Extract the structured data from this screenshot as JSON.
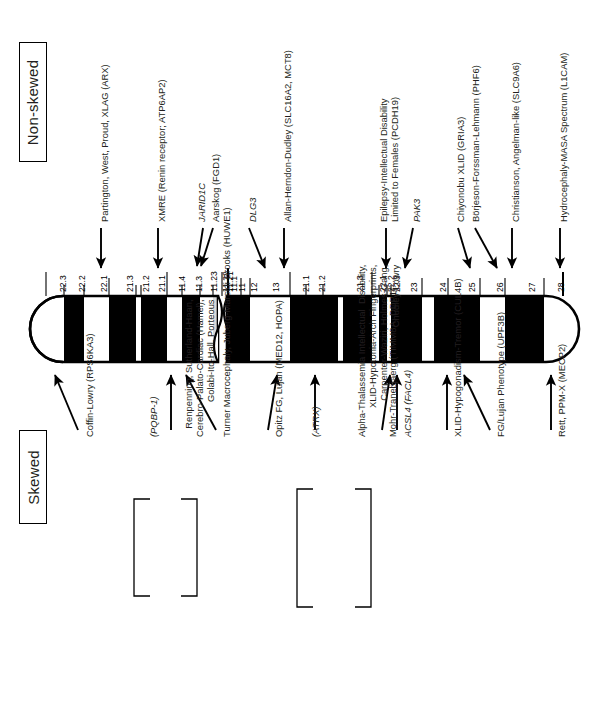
{
  "figure": {
    "type": "x-chromosome-ideogram",
    "chromosome": "X",
    "categories": {
      "top_label": "Non-skewed",
      "bottom_label": "Skewed"
    }
  },
  "bands": {
    "p_arm": [
      "22.3",
      "22.2",
      "22.1",
      "21.3",
      "21.2",
      "21.1",
      "11.4",
      "11.3",
      "11.23",
      "11.22",
      "11.21",
      "11.1"
    ],
    "q_arm": [
      "11",
      "12",
      "13",
      "21.1",
      "21.2",
      "21.3",
      "22.1",
      "22.2",
      "22.3",
      "23",
      "24",
      "25",
      "26",
      "27",
      "28"
    ]
  },
  "nonskewed_labels": [
    {
      "id": "arx",
      "text": "Partington, West, Proud, XLAG (ARX)",
      "gene": "ARX"
    },
    {
      "id": "atp6ap2",
      "text": "XMRE (Renin receptor; ATP6AP2)",
      "gene": "ATP6AP2"
    },
    {
      "id": "jarid1c",
      "text": "JARID1C",
      "gene": "JARID1C"
    },
    {
      "id": "fgd1",
      "text": "Aarskog (FGD1)",
      "gene": "FGD1"
    },
    {
      "id": "dlg3",
      "text": "DLG3",
      "gene": "DLG3"
    },
    {
      "id": "slc16a2",
      "text": "Allan-Herndon-Dudley (SLC16A2, MCT8)",
      "gene": "SLC16A2, MCT8"
    },
    {
      "id": "pcdh19",
      "text": "Epilepsy-Intellectual Disability\nLimited to Females (PCDH19)",
      "gene": "PCDH19"
    },
    {
      "id": "pak3",
      "text": "PAK3",
      "gene": "PAK3"
    },
    {
      "id": "gria3",
      "text": "Chiyonobu XLID (GRIA3)",
      "gene": "GRIA3"
    },
    {
      "id": "phf6",
      "text": "Börjeson-Forssman-Lehmann (PHF6)",
      "gene": "PHF6"
    },
    {
      "id": "slc9a6",
      "text": "Christianson, Angelman-like (SLC9A6)",
      "gene": "SLC9A6"
    },
    {
      "id": "l1cam",
      "text": "Hydrocephaly-MASA Spectrum (L1CAM)",
      "gene": "L1CAM"
    }
  ],
  "skewed_labels": [
    {
      "id": "rps6ka3",
      "text": "Coffin-Lowry (RPS6KA3)",
      "gene": "RPS6KA3"
    },
    {
      "id": "pqbp1",
      "text": "(PQBP-1)",
      "gene": "PQBP-1"
    },
    {
      "id": "pqbp1grp",
      "text": "Renpenning, Sutherland-Haan,\nCerebro-Palato-Cardiac (Hamel),\nGolabi-Ito-Hall, Porteous",
      "gene": "PQBP-1"
    },
    {
      "id": "huwe1",
      "text": "Turner Macrocephaly, Juberg-Marsidi-Brooks (HUWE1)",
      "gene": "HUWE1"
    },
    {
      "id": "med12",
      "text": "Opitz FG, Lujan (MED12, HOPA)",
      "gene": "MED12, HOPA"
    },
    {
      "id": "atrx",
      "text": "(ATRX)",
      "gene": "ATRX"
    },
    {
      "id": "atrxgrp",
      "text": "Alpha-Thalassemia Intellectual  Disability,\nXLID-Hypotonia-Arch Fingerprints,\nCarpenter-Waziri, Holmes-Gang,\nChudley-Lowry",
      "gene": "ATRX"
    },
    {
      "id": "timm8a",
      "text": "Mohr-Tranebjaerg (TIMM8A, DDP1)",
      "gene": "TIMM8A, DDP1"
    },
    {
      "id": "acsl4",
      "text": "ACSL4 (FACL4)",
      "gene": "ACSL4, FACL4"
    },
    {
      "id": "cul4b",
      "text": "XLID-Hypogonadism-Tremor (CUL4B)",
      "gene": "CUL4B"
    },
    {
      "id": "upf3b",
      "text": "FG/Lujan Phenotype (UPF3B)",
      "gene": "UPF3B"
    },
    {
      "id": "mecp2",
      "text": "Rett, PPM-X (MECP2)",
      "gene": "MECP2"
    }
  ],
  "colors": {
    "band_dark": "#000000",
    "band_light": "#ffffff",
    "centromere": "#d9d9d9",
    "outline": "#000000",
    "text": "#231f20"
  }
}
